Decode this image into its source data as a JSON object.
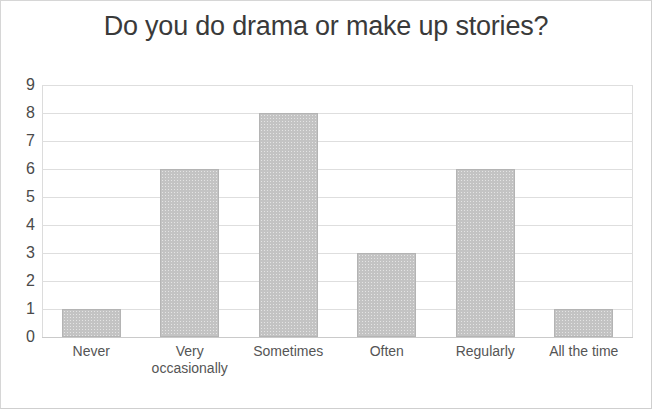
{
  "chart_data": {
    "type": "bar",
    "title": "Do you do drama or make up stories?",
    "xlabel": "",
    "ylabel": "",
    "categories": [
      "Never",
      "Very occasionally",
      "Sometimes",
      "Often",
      "Regularly",
      "All the time"
    ],
    "category_lines": [
      [
        "Never"
      ],
      [
        "Very",
        "occasionally"
      ],
      [
        "Sometimes"
      ],
      [
        "Often"
      ],
      [
        "Regularly"
      ],
      [
        "All the time"
      ]
    ],
    "values": [
      1,
      6,
      8,
      3,
      6,
      1
    ],
    "ylim": [
      0,
      9
    ],
    "ytick_labels": [
      "9",
      "8",
      "7",
      "6",
      "5",
      "4",
      "3",
      "2",
      "1",
      "0"
    ],
    "ytick_values": [
      9,
      8,
      7,
      6,
      5,
      4,
      3,
      2,
      1,
      0
    ],
    "grid": true,
    "legend": false,
    "colors": {
      "bar_fill": "#c3c3c3",
      "bar_border": "#b4b4b4",
      "gridline": "#dedede",
      "title_text": "#3a3a3a",
      "axis_text": "#4a4a4a",
      "category_text": "#555555",
      "card_background": "#ffffff",
      "card_border": "#d6d6d6"
    }
  }
}
